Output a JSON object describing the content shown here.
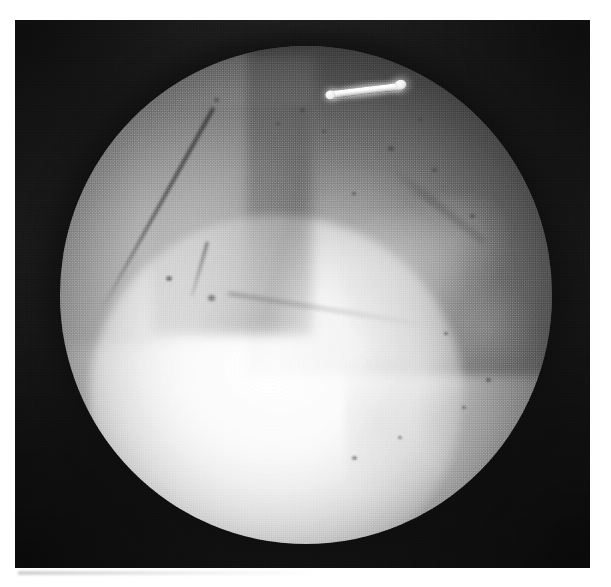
{
  "image": {
    "kind": "arthroscopic-photograph",
    "modality_label": "arthroscopy",
    "color_mode": "grayscale",
    "width_px": 611,
    "height_px": 587,
    "caption": "",
    "alt_text": "Grayscale arthroscopic view: circular endoscopic field of view showing articular cartilage and a bright metallic probe at the top"
  },
  "plate": {
    "left_px": 15,
    "top_px": 20,
    "width_px": 575,
    "height_px": 548,
    "border_color": "#ffffff",
    "background_color": "#181818"
  },
  "field_of_view": {
    "shape": "circle",
    "center_x_px": 291,
    "center_y_px": 275,
    "radius_px": 246,
    "vignette": "dark",
    "rim_color": "#1e1e1e",
    "center_color": "#fbfbfb"
  },
  "palette": {
    "paper_white": "#ffffff",
    "barrel_black": "#1b1b1b",
    "corner_black": "#141414",
    "tissue_bright": "#fbfbfb",
    "tissue_mid_gray": "#b4b4b4",
    "tissue_dark_gray": "#4e4e4e",
    "instrument_white": "#ffffff",
    "edge_line_gray": "#3c3c3c"
  },
  "instrument": {
    "name": "probe",
    "description": "bright metallic surgical probe / hook",
    "left_px": 325,
    "top_px": 84,
    "length_px": 82,
    "thickness_px": 7,
    "rotation_deg": -7,
    "highlight_color": "#ffffff"
  },
  "anatomy": {
    "regions": [
      {
        "name": "tissue-upper-left",
        "tone": "mid-gray",
        "note": "smooth cartilage surface, upper-left quadrant"
      },
      {
        "name": "tissue-upper-right",
        "tone": "dark-gray",
        "note": "shadowed mottled tissue, upper-right quadrant"
      },
      {
        "name": "tissue-bright-dome",
        "tone": "near-white",
        "note": "brightly illuminated condylar cartilage dome, lower centre"
      },
      {
        "name": "tissue-mottled",
        "tone": "light-gray",
        "note": "granular / irregular tissue, right side"
      }
    ],
    "edges": [
      {
        "name": "edge-diagonal",
        "note": "dark diagonal cartilage boundary descending from top toward the vertex",
        "angle_deg": 29
      },
      {
        "name": "edge-horizontal",
        "note": "faint boundary extending right and slightly downward from the vertex",
        "angle_deg": 9
      },
      {
        "name": "edge-notch",
        "note": "short dark notch above the vertex",
        "angle_deg": 16
      }
    ],
    "vertex": {
      "name": "edge-vertex",
      "x_px": 185,
      "y_px": 270
    }
  },
  "specks": [
    {
      "x": 300,
      "y": 108,
      "size": 5
    },
    {
      "x": 322,
      "y": 130,
      "size": 4
    },
    {
      "x": 388,
      "y": 146,
      "size": 6
    },
    {
      "x": 418,
      "y": 118,
      "size": 4
    },
    {
      "x": 432,
      "y": 168,
      "size": 5
    },
    {
      "x": 166,
      "y": 276,
      "size": 6
    },
    {
      "x": 352,
      "y": 192,
      "size": 4
    },
    {
      "x": 470,
      "y": 214,
      "size": 5
    },
    {
      "x": 444,
      "y": 332,
      "size": 4
    },
    {
      "x": 486,
      "y": 378,
      "size": 5
    },
    {
      "x": 462,
      "y": 406,
      "size": 4
    },
    {
      "x": 398,
      "y": 436,
      "size": 4
    },
    {
      "x": 352,
      "y": 456,
      "size": 5
    },
    {
      "x": 276,
      "y": 122,
      "size": 4
    },
    {
      "x": 214,
      "y": 98,
      "size": 5
    }
  ],
  "texture": {
    "pattern": "halftone-dither",
    "note": "scanned printed halftone screen grain across the whole plate"
  }
}
